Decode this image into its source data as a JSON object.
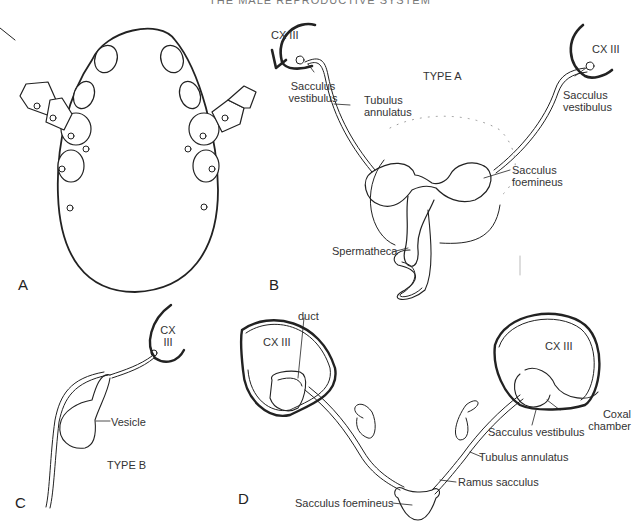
{
  "running_head": "THE MALE REPRODUCTIVE SYSTEM",
  "panels": {
    "A": {
      "letter": "A"
    },
    "B": {
      "letter": "B",
      "type": "TYPE A",
      "labels": {
        "cx_left": "CX III",
        "cx_right": "CX III",
        "sv_left_1": "Sacculus",
        "sv_left_2": "vestibulus",
        "sv_right_1": "Sacculus",
        "sv_right_2": "vestibulus",
        "tubulus_1": "Tubulus",
        "tubulus_2": "annulatus",
        "foem_1": "Sacculus",
        "foem_2": "foemineus",
        "spermatheca": "Spermatheca"
      }
    },
    "C": {
      "letter": "C",
      "type": "TYPE B",
      "labels": {
        "cx_1": "CX",
        "cx_2": "III",
        "vesicle": "Vesicle"
      }
    },
    "D": {
      "letter": "D",
      "labels": {
        "duct": "duct",
        "cx_left": "CX III",
        "cx_right": "CX III",
        "coxal_1": "Coxal",
        "coxal_2": "chamber",
        "sacculus_vestibulus": "Sacculus vestibulus",
        "tubulus_annulatus": "Tubulus annulatus",
        "ramus_sacculus": "Ramus sacculus",
        "sacculus_foemineus": "Sacculus foemineus"
      }
    }
  }
}
